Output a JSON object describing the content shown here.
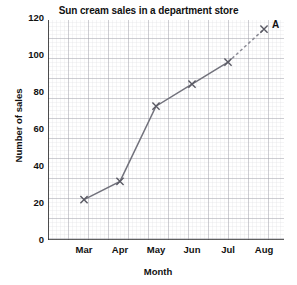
{
  "chart_data": {
    "type": "line",
    "title": "Sun cream sales in a department store",
    "xlabel": "Month",
    "ylabel": "Number of sales",
    "categories": [
      "Mar",
      "Apr",
      "May",
      "Jun",
      "Jul",
      "Aug"
    ],
    "values": [
      22,
      32,
      73,
      85,
      97,
      115
    ],
    "ylim": [
      0,
      120
    ],
    "ytick_labels": [
      "0",
      "20",
      "40",
      "60",
      "80",
      "100",
      "120"
    ],
    "ytick_values": [
      0,
      20,
      40,
      60,
      80,
      100,
      120
    ],
    "grid": true,
    "grid_minor_step": 4,
    "legend": "",
    "series": [
      {
        "name": "Sun cream sales",
        "values": [
          22,
          32,
          73,
          85,
          97,
          115
        ],
        "marker": "x",
        "line_style_observed": "solid from Mar to Jul, dashed extrapolation from Jul to Aug",
        "color": "#6e6e78"
      }
    ],
    "annotations": [
      {
        "label": "A",
        "category": "Aug",
        "value": 115,
        "description": "extrapolated point A at Aug"
      }
    ]
  },
  "colors": {
    "line": "#72727c",
    "dashed_line": "#8c8c96",
    "marker": "#5a5a64",
    "axis": "#2b2b2b",
    "grid_minor": "#d9d9de",
    "grid_major": "#9a9aa3",
    "text": "#111111",
    "background": "#ffffff"
  },
  "annotation_labels": {
    "point_a": "A"
  }
}
